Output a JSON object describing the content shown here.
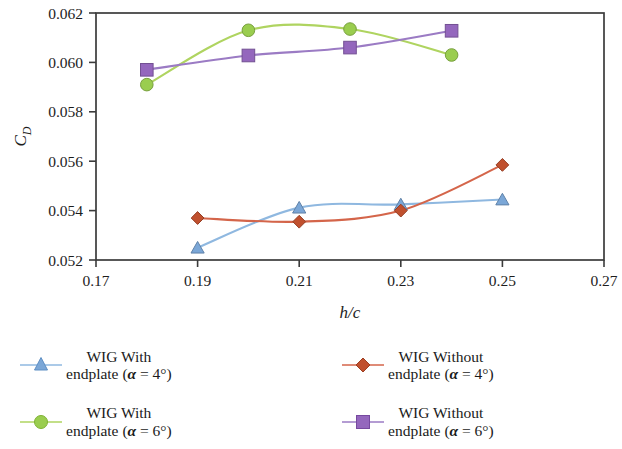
{
  "chart_data": {
    "type": "line",
    "title": "",
    "subtitle": "",
    "xlabel": "h/c",
    "ylabel": "C_D",
    "ylabel_display": "CD",
    "xlim": [
      0.17,
      0.27
    ],
    "ylim": [
      0.052,
      0.062
    ],
    "xticks": [
      0.17,
      0.19,
      0.21,
      0.23,
      0.25,
      0.27
    ],
    "yticks": [
      0.052,
      0.054,
      0.056,
      0.058,
      0.06,
      0.062
    ],
    "xtick_labels": [
      "0.17",
      "0.19",
      "0.21",
      "0.23",
      "0.25",
      "0.27"
    ],
    "ytick_labels": [
      "0.052",
      "0.054",
      "0.056",
      "0.058",
      "0.060",
      "0.062"
    ],
    "grid": false,
    "legend_position": "below",
    "series": [
      {
        "name": "WIG With endplate (alpha = 4deg)",
        "marker": "triangle",
        "color": "#7BA7D7",
        "line_color": "#8FB8E0",
        "x": [
          0.19,
          0.21,
          0.23,
          0.25
        ],
        "values": [
          0.0525,
          0.05412,
          0.05425,
          0.05445
        ]
      },
      {
        "name": "WIG Without endplate (alpha = 4deg)",
        "marker": "diamond",
        "color": "#C0502E",
        "line_color": "#D4654A",
        "x": [
          0.19,
          0.21,
          0.23,
          0.25
        ],
        "values": [
          0.0537,
          0.05355,
          0.054,
          0.05585
        ]
      },
      {
        "name": "WIG With endplate (alpha = 6deg)",
        "marker": "circle",
        "color": "#9ACD4F",
        "line_color": "#AFD460",
        "x": [
          0.18,
          0.2,
          0.22,
          0.24
        ],
        "values": [
          0.0591,
          0.0613,
          0.06135,
          0.0603
        ]
      },
      {
        "name": "WIG Without endplate (alpha = 6deg)",
        "marker": "square",
        "color": "#9467BD",
        "line_color": "#9B7BC4",
        "x": [
          0.18,
          0.2,
          0.22,
          0.24
        ],
        "values": [
          0.0597,
          0.06028,
          0.0606,
          0.06128
        ]
      }
    ]
  },
  "axes": {
    "x_title": "h/c",
    "y_title_main": "C",
    "y_title_sub": "D"
  },
  "legend": {
    "entries": [
      {
        "line1": "WIG With",
        "line2_pre": "endplate (",
        "line2_alpha": "α",
        "line2_post": " = 4°)",
        "marker": "triangle",
        "color": "#7BA7D7"
      },
      {
        "line1": "WIG Without",
        "line2_pre": "endplate (",
        "line2_alpha": "α",
        "line2_post": " = 4°)",
        "marker": "diamond",
        "color": "#C0502E"
      },
      {
        "line1": "WIG With",
        "line2_pre": "endplate (",
        "line2_alpha": "α",
        "line2_post": " = 6°)",
        "marker": "circle",
        "color": "#9ACD4F"
      },
      {
        "line1": "WIG Without",
        "line2_pre": "endplate (",
        "line2_alpha": "α",
        "line2_post": " = 6°)",
        "marker": "square",
        "color": "#9467BD"
      }
    ]
  },
  "colors": {
    "axis": "#3b3b3b",
    "text": "#1d1d1d",
    "background": "#ffffff"
  }
}
